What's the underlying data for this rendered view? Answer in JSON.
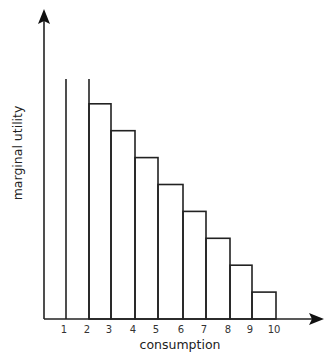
{
  "chart_data": {
    "type": "bar",
    "title": "",
    "xlabel": "consumption",
    "ylabel": "marginal utility",
    "categories": [
      "1",
      "2",
      "3",
      "4",
      "5",
      "6",
      "7",
      "8",
      "9",
      "10"
    ],
    "values": [
      null,
      9,
      8,
      7,
      6,
      5,
      4,
      3,
      2,
      1
    ],
    "grid": false,
    "legend": null
  },
  "axes": {
    "x_ticks": [
      "1",
      "2",
      "3",
      "4",
      "5",
      "6",
      "7",
      "8",
      "9",
      "10"
    ],
    "x_label": "consumption",
    "y_label": "marginal utility"
  },
  "colors": {
    "stroke": "#222222",
    "background": "#ffffff"
  }
}
